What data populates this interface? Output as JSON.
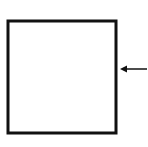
{
  "diagram": {
    "background": "#ffffff",
    "stroke_color": "#111111",
    "square": {
      "x": 8,
      "y": 21,
      "width": 108,
      "height": 112,
      "stroke_width": 3
    },
    "arrow": {
      "direction": "left",
      "x1": 148,
      "y1": 69,
      "x2": 120,
      "y2": 69,
      "stroke_width": 1.5
    }
  }
}
